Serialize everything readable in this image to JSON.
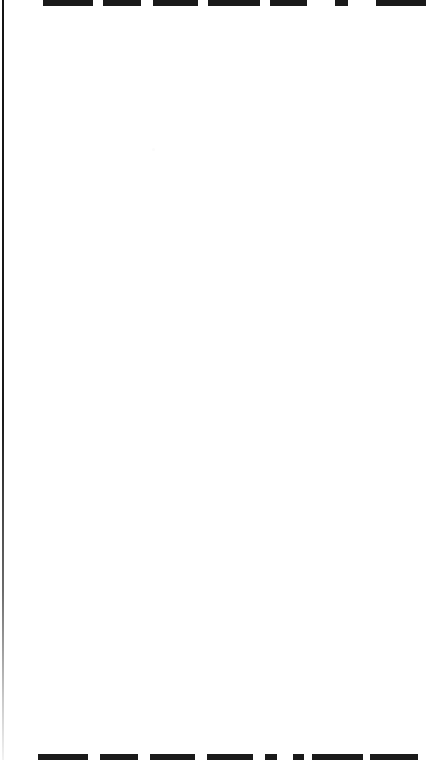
{
  "viewport": {
    "width": 438,
    "height": 760,
    "background_color": "#ffffff",
    "description": "Clipped scrolled page viewport, content cropped at top and bottom edges"
  },
  "left_rule": {
    "name": "left-margin-rule",
    "color": "#1a1a1a",
    "x": 2,
    "width": 2,
    "fades_toward": "bottom"
  },
  "page_canvas": {
    "name": "blank-page-body",
    "background_color": "#ffffff",
    "content": ""
  },
  "clipped_text": {
    "ink_color": "#1a1a1a",
    "top_row": {
      "label": "clipped heading text, bottom portion visible",
      "clip_edge": "top",
      "visible_height_px": 6,
      "fragments": [
        {
          "x": 43,
          "width": 50
        },
        {
          "x": 103,
          "width": 38
        },
        {
          "x": 153,
          "width": 45
        },
        {
          "x": 208,
          "width": 52
        },
        {
          "x": 270,
          "width": 37
        },
        {
          "x": 335,
          "width": 13
        },
        {
          "x": 376,
          "width": 50
        }
      ]
    },
    "bottom_row": {
      "label": "clipped heading text, top portion visible",
      "clip_edge": "bottom",
      "visible_height_px": 6,
      "fragments": [
        {
          "x": 38,
          "width": 50
        },
        {
          "x": 100,
          "width": 38
        },
        {
          "x": 150,
          "width": 45
        },
        {
          "x": 207,
          "width": 46
        },
        {
          "x": 265,
          "width": 12
        },
        {
          "x": 293,
          "width": 11
        },
        {
          "x": 312,
          "width": 51
        },
        {
          "x": 370,
          "width": 48
        }
      ]
    }
  }
}
